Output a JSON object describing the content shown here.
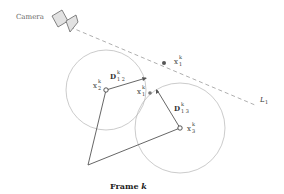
{
  "diagram": {
    "camera_label": "Camera",
    "line_label": {
      "base": "L",
      "sub": "1"
    },
    "points": {
      "x1_line": {
        "base": "x",
        "sup": "k",
        "sub": "1"
      },
      "x2": {
        "base": "x",
        "sup": "k",
        "sub": "2"
      },
      "x1_mid": {
        "base": "x",
        "sup": "k",
        "sub": "1"
      },
      "x3": {
        "base": "x",
        "sup": "k",
        "sub": "3"
      }
    },
    "distances": {
      "d12": {
        "base": "D",
        "sup": "k",
        "sub": "1 2"
      },
      "d13": {
        "base": "D",
        "sup": "k",
        "sub": "1 3"
      }
    },
    "caption": {
      "text": "Frame ",
      "var": "k"
    },
    "colors": {
      "line": "#555555",
      "circle": "#b0b0b0",
      "dashed": "#9a9a9a",
      "camera_fill": "#e0e0e0"
    }
  }
}
